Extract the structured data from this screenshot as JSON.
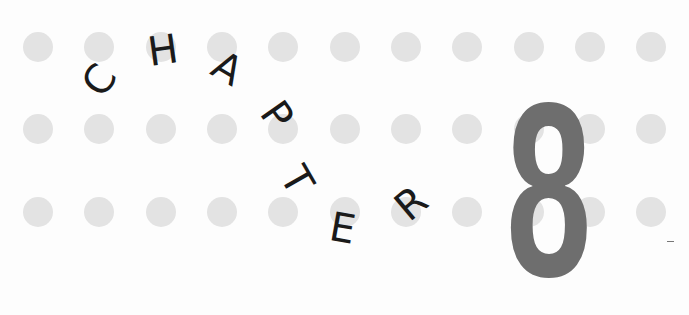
{
  "heading": {
    "word": "CHAPTER",
    "letters": [
      {
        "char": "C",
        "rotation": -55
      },
      {
        "char": "H",
        "rotation": -8
      },
      {
        "char": "A",
        "rotation": 30
      },
      {
        "char": "P",
        "rotation": 55
      },
      {
        "char": "T",
        "rotation": 60
      },
      {
        "char": "E",
        "rotation": 10
      },
      {
        "char": "R",
        "rotation": -40
      }
    ],
    "number": "8"
  },
  "colors": {
    "dot": "#e3e3e3",
    "letters": "#1a1a1a",
    "number": "#6e6e6e",
    "background": "#fdfdfd"
  },
  "dot_grid": {
    "rows": 3,
    "columns": 11
  }
}
